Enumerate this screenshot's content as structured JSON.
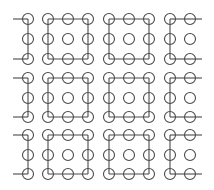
{
  "diagram": {
    "stroke_color": "#4a4a4a",
    "background": "#ffffff",
    "circle_radius": 5.5,
    "block_rows": [
      [
        19,
        39,
        59
      ],
      [
        78,
        98,
        117
      ],
      [
        135,
        155,
        174
      ]
    ],
    "block_columns": [
      {
        "type": "left-partial",
        "xs": [
          28
        ],
        "stub_left_to": 13
      },
      {
        "type": "square",
        "xs": [
          48,
          68,
          88
        ]
      },
      {
        "type": "square",
        "xs": [
          109,
          129,
          149
        ]
      },
      {
        "type": "right-partial",
        "xs": [
          170,
          190
        ],
        "stub_right_to": 202
      }
    ]
  }
}
